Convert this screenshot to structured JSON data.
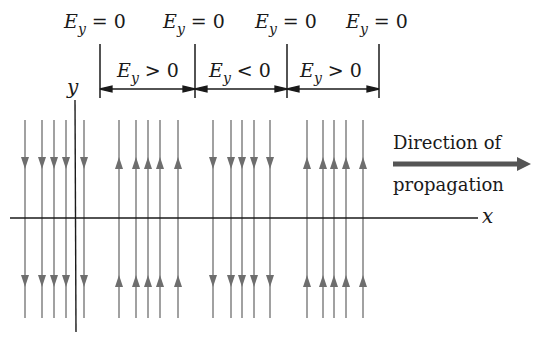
{
  "diagram": {
    "top_labels": [
      {
        "E": "E",
        "sub": "y",
        "rel": "= 0"
      },
      {
        "E": "E",
        "sub": "y",
        "rel": "= 0"
      },
      {
        "E": "E",
        "sub": "y",
        "rel": "= 0"
      },
      {
        "E": "E",
        "sub": "y",
        "rel": "= 0"
      }
    ],
    "region_labels": [
      {
        "E": "E",
        "sub": "y",
        "rel": "> 0"
      },
      {
        "E": "E",
        "sub": "y",
        "rel": "< 0"
      },
      {
        "E": "E",
        "sub": "y",
        "rel": "> 0"
      }
    ],
    "axes": {
      "x_label": "x",
      "y_label": "y"
    },
    "propagation": {
      "line1": "Direction of",
      "line2": "propagation"
    },
    "field_groups": [
      {
        "direction": "down",
        "xs": [
          25,
          42,
          54,
          66,
          84
        ]
      },
      {
        "direction": "up",
        "xs": [
          119,
          136,
          148,
          160,
          178
        ]
      },
      {
        "direction": "down",
        "xs": [
          213,
          231,
          242,
          254,
          270
        ]
      },
      {
        "direction": "up",
        "xs": [
          307,
          323,
          334,
          346,
          363
        ]
      }
    ],
    "colors": {
      "field_line": "#8a8a8a",
      "ink": "#1a1a1a",
      "arrow": "#6e6e6e"
    }
  }
}
